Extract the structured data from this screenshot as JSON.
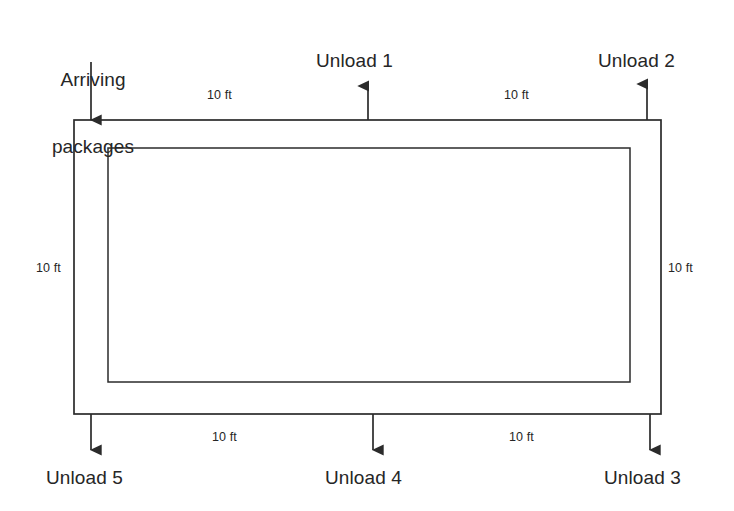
{
  "diagram": {
    "type": "flow-layout-diagram",
    "stroke_color": "#2b2b2b",
    "fill_color": "#ffffff",
    "background": "#ffffff",
    "source": {
      "label_line1": "Arriving",
      "label_line2": "packages",
      "arrow_direction": "down",
      "entry_side": "top-left"
    },
    "stations": [
      {
        "id": "unload-1",
        "label": "Unload 1",
        "arrow_direction": "up",
        "side": "top"
      },
      {
        "id": "unload-2",
        "label": "Unload 2",
        "arrow_direction": "up",
        "side": "top"
      },
      {
        "id": "unload-3",
        "label": "Unload 3",
        "arrow_direction": "down",
        "side": "bottom"
      },
      {
        "id": "unload-4",
        "label": "Unload 4",
        "arrow_direction": "down",
        "side": "bottom"
      },
      {
        "id": "unload-5",
        "label": "Unload 5",
        "arrow_direction": "down",
        "side": "bottom"
      }
    ],
    "dimensions": [
      {
        "id": "dim-top-left",
        "value": "10 ft",
        "position": "top-left-segment"
      },
      {
        "id": "dim-top-right",
        "value": "10 ft",
        "position": "top-right-segment"
      },
      {
        "id": "dim-left",
        "value": "10 ft",
        "position": "left-side"
      },
      {
        "id": "dim-right",
        "value": "10 ft",
        "position": "right-side"
      },
      {
        "id": "dim-bottom-left",
        "value": "10 ft",
        "position": "bottom-left-segment"
      },
      {
        "id": "dim-bottom-right",
        "value": "10 ft",
        "position": "bottom-right-segment"
      }
    ]
  }
}
